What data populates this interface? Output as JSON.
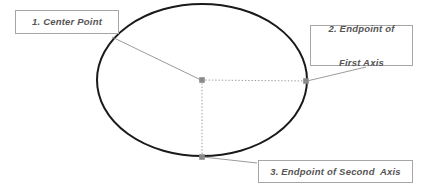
{
  "diagram": {
    "type": "annotated-ellipse-diagram",
    "canvas": {
      "width": 434,
      "height": 189,
      "background": "#ffffff"
    },
    "colors": {
      "ellipse_stroke": "#1a1a1a",
      "guide_line": "#9a9a9a",
      "leader_line": "#8f8f8f",
      "marker": "#8a8a8a",
      "callout_border": "#a6a6a6",
      "callout_background": "#ffffff",
      "callout_text": "#555555"
    },
    "ellipse": {
      "center_x": 202,
      "center_y": 80,
      "radius_x": 105,
      "radius_y": 76,
      "stroke_width": 2
    },
    "points": [
      {
        "id": "center-point",
        "label": "Center Point",
        "x": 202,
        "y": 80
      },
      {
        "id": "first-axis-endpoint",
        "label": "Endpoint of First Axis",
        "x": 306,
        "y": 81
      },
      {
        "id": "second-axis-endpoint",
        "label": "Endpoint of Second Axis",
        "x": 202,
        "y": 157
      }
    ],
    "guides": [
      {
        "id": "first-axis-guide",
        "from_x": 202,
        "from_y": 80,
        "to_x": 306,
        "to_y": 81,
        "style": "dotted"
      },
      {
        "id": "second-axis-guide",
        "from_x": 202,
        "from_y": 80,
        "to_x": 202,
        "to_y": 157,
        "style": "dotted"
      }
    ],
    "leaders": [
      {
        "id": "leader-center-point",
        "from_x": 112,
        "from_y": 37,
        "to_x": 201,
        "to_y": 80
      },
      {
        "id": "leader-first-axis",
        "from_x": 366,
        "from_y": 67,
        "to_x": 307,
        "to_y": 81
      },
      {
        "id": "leader-second-axis",
        "from_x": 257,
        "from_y": 163,
        "to_x": 203,
        "to_y": 157
      }
    ]
  },
  "callouts": {
    "center_point": {
      "number": "1.",
      "text": "1. Center Point"
    },
    "first_axis": {
      "number": "2.",
      "line1": "2. Endpoint of",
      "line2": "First Axis"
    },
    "second_axis": {
      "number": "3.",
      "text": "3. Endpoint of Second  Axis"
    }
  }
}
